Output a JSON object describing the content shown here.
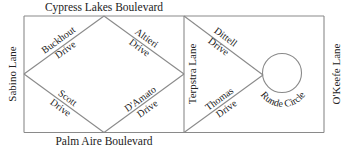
{
  "map": {
    "boulevards": {
      "top": "Cypress Lakes Boulevard",
      "bottom": "Palm Aire Boulevard"
    },
    "lanes": {
      "left": "Sabino Lane",
      "middle": "Terpstra Lane",
      "right": "O'Keefe Lane"
    },
    "drives": {
      "buckhout": {
        "line1": "Buckhout",
        "line2": "Drive"
      },
      "altieri": {
        "line1": "Altieri",
        "line2": "Drive"
      },
      "scott": {
        "line1": "Scott",
        "line2": "Drive"
      },
      "damato": {
        "line1": "D'Amato",
        "line2": "Drive"
      },
      "dittell": {
        "line1": "Dittell",
        "line2": "Drive"
      },
      "thomas": {
        "line1": "Thomas",
        "line2": "Drive"
      }
    },
    "circle": "Runde Circle",
    "colors": {
      "road": "#8a8a8a",
      "text": "#222222",
      "background": "#ffffff"
    }
  }
}
